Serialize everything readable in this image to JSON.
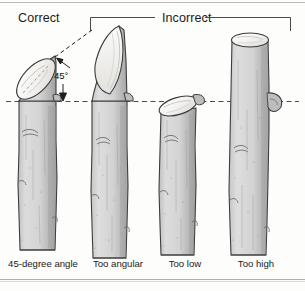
{
  "figure": {
    "title_correct": "Correct",
    "title_incorrect": "Incorrect",
    "angle_annotation": "45°",
    "captions": [
      "45-degree angle",
      "Too angular",
      "Too low",
      "Too high"
    ],
    "panels": [
      {
        "index": 0,
        "caption": "45-degree angle",
        "group": "Correct",
        "cut_type": "angled-45",
        "icon": "pruned-stem-icon"
      },
      {
        "index": 1,
        "caption": "Too angular",
        "group": "Incorrect",
        "cut_type": "steep-long-bevel",
        "icon": "pruned-stem-icon"
      },
      {
        "index": 2,
        "caption": "Too low",
        "group": "Incorrect",
        "cut_type": "shallow-low-cut",
        "icon": "pruned-stem-icon"
      },
      {
        "index": 3,
        "caption": "Too high",
        "group": "Incorrect",
        "cut_type": "flat-high-cut",
        "icon": "pruned-stem-icon"
      }
    ],
    "colors": {
      "stem_fill": "#d2d2d2",
      "stem_shadow": "#a9a9a9",
      "cut_face": "#f2f1ee",
      "outline": "#3a3a3a",
      "guide_line": "#4a4a4a",
      "background": "#fdfdfc"
    },
    "guides": {
      "reference_line": "dashed-horizontal",
      "reference_line_y": 101,
      "bracket_label": "Incorrect"
    }
  }
}
